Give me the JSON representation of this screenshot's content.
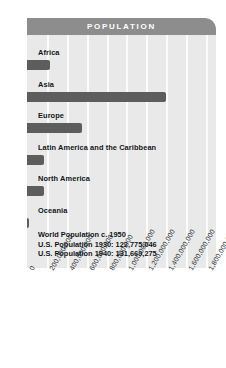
{
  "panel": {
    "header_title": "POPULATION"
  },
  "chart_data": {
    "type": "bar",
    "orientation": "horizontal",
    "title": "POPULATION",
    "xlabel": "",
    "ylabel": "",
    "categories": [
      "Africa",
      "Asia",
      "Europe",
      "Latin America and the Caribbean",
      "North America",
      "Oceania"
    ],
    "values": [
      228000000,
      1395000000,
      549000000,
      168000000,
      172000000,
      12700000
    ],
    "xlim": [
      0,
      1900000000
    ],
    "tick_labels": [
      "0",
      "200,000,000",
      "400,000,000",
      "600,000,000",
      "800,000,000",
      "1,000,000,000",
      "1,200,000,000",
      "1,400,000,000",
      "1,600,000,000",
      "1,800,000,000"
    ],
    "tick_values": [
      0,
      200000000,
      400000000,
      600000000,
      800000000,
      1000000000,
      1200000000,
      1400000000,
      1600000000,
      1800000000
    ],
    "grid": true,
    "legend": null,
    "bar_color": "#5d5d5d",
    "panel_color": "#e9e9e9",
    "header_color": "#8d8d8d",
    "annotations": [
      "World Population c. 1950",
      "U.S. Population 1930: 122,775,046",
      "U.S. Population 1940: 131,669,275"
    ]
  }
}
